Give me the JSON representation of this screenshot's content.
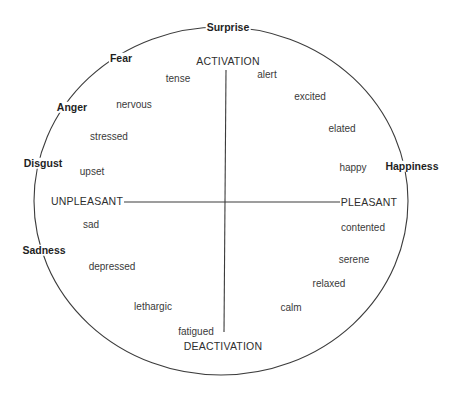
{
  "diagram": {
    "colors": {
      "line": "#3c3c3c",
      "text": "#2a2a2a",
      "background": "#ffffff"
    },
    "circle": {
      "cx": 221,
      "cy": 201,
      "rx": 187,
      "ry": 174
    },
    "axes": {
      "vertical": {
        "x": 226,
        "y1": 70,
        "y2": 332,
        "top_label": "ACTIVATION",
        "bottom_label": "DEACTIVATION"
      },
      "horizontal": {
        "y": 202,
        "x1": 124,
        "x2": 340,
        "left_label": "UNPLEASANT",
        "right_label": "PLEASANT"
      }
    },
    "categories": [
      {
        "label": "Surprise",
        "x": 228,
        "y": 27
      },
      {
        "label": "Fear",
        "x": 121,
        "y": 58
      },
      {
        "label": "Anger",
        "x": 72,
        "y": 107
      },
      {
        "label": "Disgust",
        "x": 43,
        "y": 163
      },
      {
        "label": "Sadness",
        "x": 44,
        "y": 250
      },
      {
        "label": "Happiness",
        "x": 412,
        "y": 166
      }
    ],
    "emotions": [
      {
        "label": "tense",
        "x": 178,
        "y": 79
      },
      {
        "label": "alert",
        "x": 267,
        "y": 75
      },
      {
        "label": "nervous",
        "x": 134,
        "y": 105
      },
      {
        "label": "excited",
        "x": 310,
        "y": 97
      },
      {
        "label": "stressed",
        "x": 109,
        "y": 137
      },
      {
        "label": "elated",
        "x": 342,
        "y": 129
      },
      {
        "label": "upset",
        "x": 92,
        "y": 172
      },
      {
        "label": "happy",
        "x": 353,
        "y": 168
      },
      {
        "label": "sad",
        "x": 91,
        "y": 225
      },
      {
        "label": "contented",
        "x": 363,
        "y": 228
      },
      {
        "label": "depressed",
        "x": 112,
        "y": 267
      },
      {
        "label": "serene",
        "x": 354,
        "y": 260
      },
      {
        "label": "relaxed",
        "x": 329,
        "y": 284
      },
      {
        "label": "lethargic",
        "x": 153,
        "y": 307
      },
      {
        "label": "calm",
        "x": 291,
        "y": 308
      },
      {
        "label": "fatigued",
        "x": 196,
        "y": 332
      }
    ],
    "axis_labels": [
      {
        "key": "activation",
        "label": "ACTIVATION",
        "x": 228,
        "y": 61
      },
      {
        "key": "deactivation",
        "label": "DEACTIVATION",
        "x": 223,
        "y": 346
      },
      {
        "key": "unpleasant",
        "label": "UNPLEASANT",
        "x": 87,
        "y": 201
      },
      {
        "key": "pleasant",
        "label": "PLEASANT",
        "x": 369,
        "y": 202
      }
    ]
  }
}
